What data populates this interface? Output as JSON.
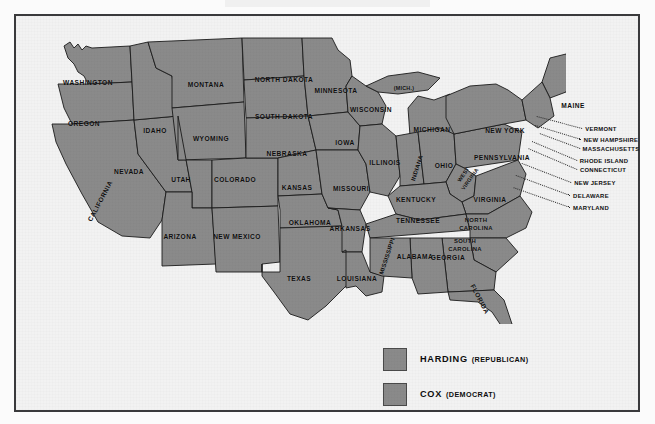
{
  "map": {
    "title": "1920 United States Presidential Election Results",
    "fill_color": "#8a8a8a",
    "border_color": "#1b1b1b",
    "background_color": "#f2f2f2",
    "frame_color": "#3a3a3c",
    "states": [
      {
        "name": "WASHINGTON",
        "x": 72,
        "y": 66,
        "rot": 0,
        "size": "n"
      },
      {
        "name": "OREGON",
        "x": 68,
        "y": 107,
        "rot": 0,
        "size": "n"
      },
      {
        "name": "IDAHO",
        "x": 139,
        "y": 114,
        "rot": 0,
        "size": "n"
      },
      {
        "name": "MONTANA",
        "x": 190,
        "y": 68,
        "rot": 0,
        "size": "n"
      },
      {
        "name": "WYOMING",
        "x": 195,
        "y": 122,
        "rot": 0,
        "size": "n"
      },
      {
        "name": "NEVADA",
        "x": 113,
        "y": 155,
        "rot": 0,
        "size": "n"
      },
      {
        "name": "UTAH",
        "x": 165,
        "y": 163,
        "rot": 0,
        "size": "n"
      },
      {
        "name": "COLORADO",
        "x": 219,
        "y": 163,
        "rot": 0,
        "size": "n"
      },
      {
        "name": "CALIFORNIA",
        "x": 84,
        "y": 185,
        "rot": -62,
        "size": "n"
      },
      {
        "name": "ARIZONA",
        "x": 164,
        "y": 220,
        "rot": 0,
        "size": "n"
      },
      {
        "name": "NEW MEXICO",
        "x": 221,
        "y": 220,
        "rot": 0,
        "size": "n"
      },
      {
        "name": "NORTH DAKOTA",
        "x": 268,
        "y": 63,
        "rot": 0,
        "size": "n"
      },
      {
        "name": "SOUTH DAKOTA",
        "x": 268,
        "y": 100,
        "rot": 0,
        "size": "n"
      },
      {
        "name": "NEBRASKA",
        "x": 271,
        "y": 137,
        "rot": 0,
        "size": "n"
      },
      {
        "name": "KANSAS",
        "x": 281,
        "y": 171,
        "rot": 0,
        "size": "n"
      },
      {
        "name": "OKLAHOMA",
        "x": 294,
        "y": 206,
        "rot": 0,
        "size": "n"
      },
      {
        "name": "TEXAS",
        "x": 283,
        "y": 262,
        "rot": 0,
        "size": "n"
      },
      {
        "name": "MINNESOTA",
        "x": 320,
        "y": 74,
        "rot": 0,
        "size": "n"
      },
      {
        "name": "IOWA",
        "x": 329,
        "y": 126,
        "rot": 0,
        "size": "n"
      },
      {
        "name": "MISSOURI",
        "x": 335,
        "y": 172,
        "rot": 0,
        "size": "n"
      },
      {
        "name": "ARKANSAS",
        "x": 334,
        "y": 212,
        "rot": 0,
        "size": "n"
      },
      {
        "name": "LOUISIANA",
        "x": 341,
        "y": 262,
        "rot": 0,
        "size": "n"
      },
      {
        "name": "WISCONSIN",
        "x": 355,
        "y": 93,
        "rot": 0,
        "size": "n"
      },
      {
        "name": "(MICH.)",
        "x": 388,
        "y": 72,
        "rot": 0,
        "size": "tiny"
      },
      {
        "name": "MICHIGAN",
        "x": 416,
        "y": 113,
        "rot": 0,
        "size": "n"
      },
      {
        "name": "ILLINOIS",
        "x": 369,
        "y": 146,
        "rot": 0,
        "size": "n"
      },
      {
        "name": "INDIANA",
        "x": 401,
        "y": 152,
        "rot": -72,
        "size": "sm"
      },
      {
        "name": "OHIO",
        "x": 428,
        "y": 149,
        "rot": 0,
        "size": "n"
      },
      {
        "name": "KENTUCKY",
        "x": 400,
        "y": 183,
        "rot": 0,
        "size": "n"
      },
      {
        "name": "TENNESSEE",
        "x": 402,
        "y": 204,
        "rot": 0,
        "size": "n"
      },
      {
        "name": "MISSISSIPPI",
        "x": 371,
        "y": 240,
        "rot": -72,
        "size": "sm"
      },
      {
        "name": "ALABAMA",
        "x": 399,
        "y": 240,
        "rot": 0,
        "size": "n"
      },
      {
        "name": "GEORGIA",
        "x": 432,
        "y": 241,
        "rot": 0,
        "size": "n"
      },
      {
        "name": "FLORIDA",
        "x": 464,
        "y": 283,
        "rot": 62,
        "size": "n"
      },
      {
        "name": "WEST\nVIRGINIA",
        "x": 451,
        "y": 161,
        "rot": -55,
        "size": "tiny"
      },
      {
        "name": "VIRGINIA",
        "x": 474,
        "y": 183,
        "rot": 0,
        "size": "n"
      },
      {
        "name": "NORTH\nCAROLINA",
        "x": 460,
        "y": 209,
        "rot": 0,
        "size": "sm"
      },
      {
        "name": "SOUTH\nCAROLINA",
        "x": 449,
        "y": 230,
        "rot": 0,
        "size": "sm"
      },
      {
        "name": "PENNSYLVANIA",
        "x": 486,
        "y": 141,
        "rot": 0,
        "size": "n"
      },
      {
        "name": "NEW YORK",
        "x": 489,
        "y": 114,
        "rot": 0,
        "size": "n"
      },
      {
        "name": "MAINE",
        "x": 557,
        "y": 89,
        "rot": 0,
        "size": "n"
      }
    ],
    "callout_labels": [
      {
        "name": "VERMONT",
        "x": 585,
        "y": 113
      },
      {
        "name": "NEW HAMPSHIRE",
        "x": 595,
        "y": 124
      },
      {
        "name": "MASSACHUSETTS",
        "x": 595,
        "y": 133
      },
      {
        "name": "RHODE ISLAND",
        "x": 588,
        "y": 145
      },
      {
        "name": "CONNECTICUT",
        "x": 587,
        "y": 154
      },
      {
        "name": "NEW JERSEY",
        "x": 579,
        "y": 167
      },
      {
        "name": "DELAWARE",
        "x": 575,
        "y": 180
      },
      {
        "name": "MARYLAND",
        "x": 575,
        "y": 192
      }
    ]
  },
  "legend": {
    "items": [
      {
        "candidate": "HARDING",
        "party": "(REPUBLICAN)",
        "color": "#8a8a8a"
      },
      {
        "candidate": "COX",
        "party": "(DEMOCRAT)",
        "color": "#8a8a8a"
      }
    ]
  }
}
